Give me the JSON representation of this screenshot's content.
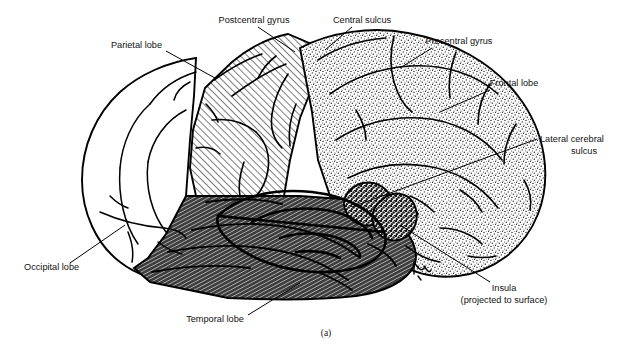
{
  "figure": {
    "caption": "(a)",
    "background_color": "#ffffff",
    "ink_color": "#000000",
    "title_note": "Lateral view of the cerebral hemisphere"
  },
  "labels": [
    {
      "id": "parietal-lobe",
      "text": "Parietal lobe",
      "text2": "",
      "anchor": "end",
      "x": 162,
      "y": 48,
      "leader": [
        [
          166,
          51
        ],
        [
          215,
          78
        ]
      ]
    },
    {
      "id": "postcentral-gyrus",
      "text": "Postcentral gyrus",
      "text2": "",
      "anchor": "middle",
      "x": 254,
      "y": 23,
      "leader": [
        [
          258,
          27
        ],
        [
          295,
          52
        ]
      ]
    },
    {
      "id": "central-sulcus",
      "text": "Central sulcus",
      "text2": "",
      "anchor": "middle",
      "x": 362,
      "y": 23,
      "leader": [
        [
          352,
          27
        ],
        [
          325,
          50
        ]
      ]
    },
    {
      "id": "precentral-gyrus",
      "text": "Precentral gyrus",
      "text2": "",
      "anchor": "middle",
      "x": 459,
      "y": 44,
      "leader": [
        [
          432,
          48
        ],
        [
          400,
          68
        ]
      ]
    },
    {
      "id": "frontal-lobe",
      "text": "Frontal lobe",
      "text2": "",
      "anchor": "middle",
      "x": 514,
      "y": 86,
      "leader": [
        [
          490,
          90
        ],
        [
          440,
          112
        ]
      ]
    },
    {
      "id": "lateral-cerebral-sulcus",
      "text": "Lateral cerebral",
      "text2": "sulcus",
      "anchor": "start",
      "x": 540,
      "y": 142,
      "leader": [
        [
          537,
          139
        ],
        [
          352,
          207
        ]
      ]
    },
    {
      "id": "insula",
      "text": "Insula",
      "text2": "(projected to surface)",
      "anchor": "middle",
      "x": 504,
      "y": 291,
      "leader": [
        [
          490,
          282
        ],
        [
          400,
          225
        ]
      ]
    },
    {
      "id": "occipital-lobe",
      "text": "Occipital lobe",
      "text2": "",
      "anchor": "start",
      "x": 24,
      "y": 270,
      "leader": [
        [
          70,
          263
        ],
        [
          125,
          225
        ]
      ]
    },
    {
      "id": "temporal-lobe",
      "text": "Temporal lobe",
      "text2": "",
      "anchor": "middle",
      "x": 215,
      "y": 322,
      "leader": [
        [
          248,
          315
        ],
        [
          300,
          283
        ]
      ]
    }
  ],
  "regions": [
    {
      "id": "occipital-lobe-region",
      "name": "Occipital lobe",
      "fill_style": "plain-white"
    },
    {
      "id": "parietal-lobe-region",
      "name": "Parietal lobe",
      "fill_style": "diagonal-hatch"
    },
    {
      "id": "frontal-lobe-region",
      "name": "Frontal lobe",
      "fill_style": "stipple"
    },
    {
      "id": "temporal-lobe-region",
      "name": "Temporal lobe",
      "fill_style": "dense-dark-hatch"
    },
    {
      "id": "insula-region",
      "name": "Insula",
      "fill_style": "dark-coarse-stipple"
    }
  ]
}
